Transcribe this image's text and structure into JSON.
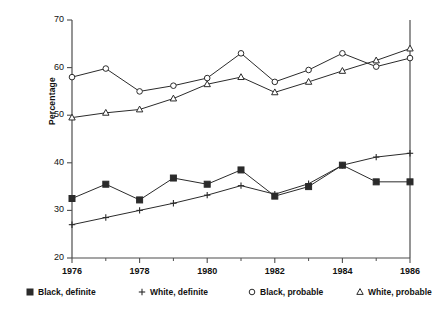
{
  "chart_data": {
    "type": "line",
    "title": "",
    "xlabel": "",
    "ylabel": "Percentage",
    "x": [
      1976,
      1977,
      1978,
      1979,
      1980,
      1981,
      1982,
      1983,
      1984,
      1985,
      1986
    ],
    "xlim": [
      1976,
      1986
    ],
    "ylim": [
      20,
      70
    ],
    "xticks": [
      1976,
      1978,
      1980,
      1982,
      1984,
      1986
    ],
    "xtick_labels": [
      "1976",
      "1978",
      "1980",
      "1982",
      "1984",
      "1986"
    ],
    "xminor_ticks": [
      1977,
      1979,
      1981,
      1983,
      1985
    ],
    "yticks": [
      20,
      30,
      40,
      50,
      60,
      70
    ],
    "ytick_labels": [
      "20",
      "30",
      "40",
      "50",
      "60",
      "70"
    ],
    "grid": false,
    "legend_position": "bottom",
    "series": [
      {
        "name": "Black, definite",
        "marker": "square",
        "values": [
          32.5,
          35.5,
          32.2,
          36.8,
          35.5,
          38.5,
          33.0,
          35.0,
          39.5,
          36.0,
          36.0
        ]
      },
      {
        "name": "White, definite",
        "marker": "plus",
        "values": [
          27.0,
          28.5,
          30.0,
          31.5,
          33.2,
          35.2,
          33.4,
          35.6,
          39.5,
          41.2,
          42.0
        ]
      },
      {
        "name": "Black, probable",
        "marker": "circle",
        "values": [
          58.0,
          59.8,
          55.0,
          56.2,
          57.8,
          63.0,
          57.0,
          59.5,
          63.0,
          60.2,
          62.0
        ]
      },
      {
        "name": "White, probable",
        "marker": "triangle",
        "values": [
          49.5,
          50.5,
          51.2,
          53.5,
          56.5,
          58.0,
          54.8,
          57.0,
          59.3,
          61.5,
          64.0
        ]
      }
    ]
  },
  "legend": {
    "items": [
      {
        "label": "Black, definite",
        "marker": "square-marker-icon"
      },
      {
        "label": "White, definite",
        "marker": "plus-marker-icon"
      },
      {
        "label": "Black, probable",
        "marker": "circle-marker-icon"
      },
      {
        "label": "White, probable",
        "marker": "triangle-marker-icon"
      }
    ]
  },
  "colors": {
    "line": "#2b2b2b",
    "axis": "#4d4d4d",
    "text": "#111111",
    "background": "#ffffff"
  }
}
